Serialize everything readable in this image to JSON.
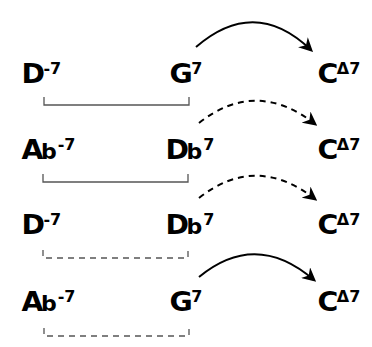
{
  "diagram": {
    "rows": [
      {
        "ii": {
          "root": "D",
          "accidental": "",
          "quality": "-7"
        },
        "V": {
          "root": "G",
          "accidental": "",
          "quality": "7"
        },
        "I": {
          "root": "C",
          "accidental": "",
          "quality": "Δ7"
        },
        "bracket_style": "solid",
        "arrow_style": "solid"
      },
      {
        "ii": {
          "root": "A",
          "accidental": "b",
          "quality": "-7"
        },
        "V": {
          "root": "D",
          "accidental": "b",
          "quality": "7"
        },
        "I": {
          "root": "C",
          "accidental": "",
          "quality": "Δ7"
        },
        "bracket_style": "solid",
        "arrow_style": "dashed"
      },
      {
        "ii": {
          "root": "D",
          "accidental": "",
          "quality": "-7"
        },
        "V": {
          "root": "D",
          "accidental": "b",
          "quality": "7"
        },
        "I": {
          "root": "C",
          "accidental": "",
          "quality": "Δ7"
        },
        "bracket_style": "dashed",
        "arrow_style": "dashed"
      },
      {
        "ii": {
          "root": "A",
          "accidental": "b",
          "quality": "-7"
        },
        "V": {
          "root": "G",
          "accidental": "",
          "quality": "7"
        },
        "I": {
          "root": "C",
          "accidental": "",
          "quality": "Δ7"
        },
        "bracket_style": "dashed",
        "arrow_style": "solid"
      }
    ],
    "colors": {
      "ink": "#000000",
      "bracket": "#555555",
      "background": "#ffffff"
    }
  }
}
